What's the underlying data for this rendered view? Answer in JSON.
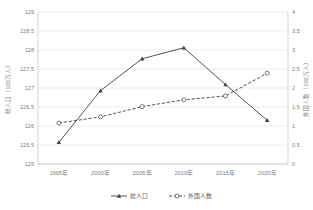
{
  "chart_data": {
    "type": "line",
    "title": "",
    "xlabel": "",
    "categories": [
      "1995年",
      "2000年",
      "2005年",
      "2010年",
      "2015年",
      "2020年"
    ],
    "grid": true,
    "legend_position": "bottom",
    "axes": {
      "left": {
        "label": "総人口（100万人）",
        "min": 125,
        "max": 129,
        "step": 0.5,
        "ticks": [
          "125",
          "125.5",
          "126",
          "126.5",
          "127",
          "127.5",
          "128",
          "128.5",
          "129"
        ]
      },
      "right": {
        "label": "外国人数（100万人）",
        "min": 0,
        "max": 4,
        "step": 0.5,
        "ticks": [
          "0",
          "0.5",
          "1",
          "1.5",
          "2",
          "2.5",
          "3",
          "3.5",
          "4"
        ]
      }
    },
    "series": [
      {
        "name": "総人口",
        "axis": "left",
        "marker": "triangle",
        "line": "solid",
        "color": "#404040",
        "values": [
          125.57,
          126.93,
          127.77,
          128.06,
          127.09,
          126.15
        ]
      },
      {
        "name": "外国人数",
        "axis": "right",
        "marker": "circle",
        "line": "dashed",
        "color": "#404040",
        "values": [
          1.08,
          1.24,
          1.51,
          1.69,
          1.79,
          2.39
        ]
      }
    ]
  },
  "legend": {
    "items": [
      {
        "label": "総人口"
      },
      {
        "label": "外国人数"
      }
    ]
  },
  "footer": {
    "note": ""
  }
}
